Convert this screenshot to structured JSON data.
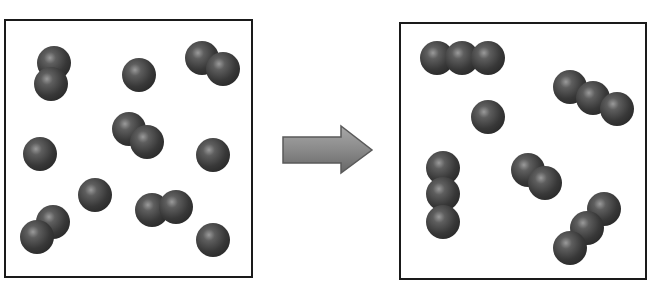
{
  "diagram": {
    "panels": [
      {
        "name": "before",
        "molecules": [
          {
            "type": "diatomic",
            "atoms": [
              [
                54,
                63
              ],
              [
                51,
                84
              ]
            ]
          },
          {
            "type": "monatomic",
            "atoms": [
              [
                139,
                75
              ]
            ]
          },
          {
            "type": "diatomic",
            "atoms": [
              [
                202,
                58
              ],
              [
                223,
                69
              ]
            ]
          },
          {
            "type": "diatomic",
            "atoms": [
              [
                129,
                129
              ],
              [
                147,
                142
              ]
            ]
          },
          {
            "type": "monatomic",
            "atoms": [
              [
                40,
                154
              ]
            ]
          },
          {
            "type": "monatomic",
            "atoms": [
              [
                213,
                155
              ]
            ]
          },
          {
            "type": "monatomic",
            "atoms": [
              [
                95,
                195
              ]
            ]
          },
          {
            "type": "diatomic",
            "atoms": [
              [
                152,
                210
              ],
              [
                176,
                207
              ]
            ]
          },
          {
            "type": "diatomic",
            "atoms": [
              [
                53,
                222
              ],
              [
                37,
                237
              ]
            ]
          },
          {
            "type": "monatomic",
            "atoms": [
              [
                213,
                240
              ]
            ]
          }
        ]
      },
      {
        "name": "after",
        "molecules": [
          {
            "type": "triatomic",
            "atoms": [
              [
                437,
                58
              ],
              [
                462,
                58
              ],
              [
                488,
                58
              ]
            ]
          },
          {
            "type": "monatomic",
            "atoms": [
              [
                488,
                117
              ]
            ]
          },
          {
            "type": "triatomic",
            "atoms": [
              [
                570,
                87
              ],
              [
                593,
                98
              ],
              [
                617,
                109
              ]
            ]
          },
          {
            "type": "triatomic",
            "atoms": [
              [
                443,
                168
              ],
              [
                443,
                194
              ],
              [
                443,
                222
              ]
            ]
          },
          {
            "type": "diatomic",
            "atoms": [
              [
                528,
                170
              ],
              [
                545,
                183
              ]
            ]
          },
          {
            "type": "triatomic",
            "atoms": [
              [
                604,
                209
              ],
              [
                587,
                228
              ],
              [
                570,
                248
              ]
            ]
          }
        ]
      }
    ],
    "arrow": {
      "direction": "right",
      "color": "#8a8a8a",
      "edge_color": "#5a5a5a"
    },
    "atom": {
      "radius": 17,
      "base_color": "#3a3a3a",
      "highlight_color": "#8e8e8e"
    }
  }
}
